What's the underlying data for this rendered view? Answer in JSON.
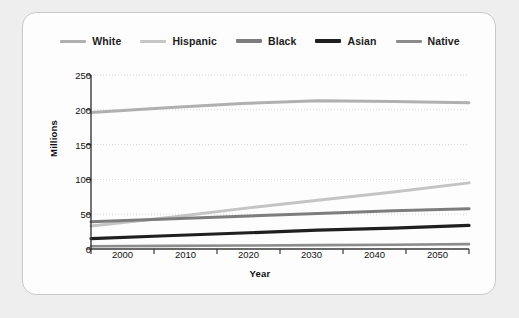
{
  "chart_data": {
    "type": "line",
    "title": "",
    "xlabel": "Year",
    "ylabel": "Millions",
    "x": [
      2000,
      2010,
      2020,
      2030,
      2040,
      2050
    ],
    "xlim": [
      2000,
      2050
    ],
    "ylim": [
      0,
      250
    ],
    "yticks": [
      0,
      50,
      100,
      150,
      200,
      250
    ],
    "xticks": [
      2000,
      2010,
      2020,
      2030,
      2040,
      2050
    ],
    "grid": true,
    "legend_position": "top",
    "series": [
      {
        "name": "White",
        "color": "#b0b0b0",
        "width": 3.0,
        "values": [
          196,
          203,
          209,
          213,
          212,
          210
        ]
      },
      {
        "name": "Hispanic",
        "color": "#c4c4c4",
        "width": 3.0,
        "values": [
          33,
          45,
          58,
          70,
          82,
          95
        ]
      },
      {
        "name": "Black",
        "color": "#7d7d7d",
        "width": 3.0,
        "values": [
          39,
          43,
          47,
          51,
          55,
          58
        ]
      },
      {
        "name": "Asian",
        "color": "#1f1f1f",
        "width": 3.2,
        "values": [
          15,
          19,
          23,
          27,
          30,
          34
        ]
      },
      {
        "name": "Native",
        "color": "#8c8c8c",
        "width": 2.6,
        "values": [
          4,
          4.5,
          5,
          5.5,
          6,
          7
        ]
      }
    ]
  },
  "legend": {
    "items": [
      {
        "label": "White",
        "color": "#b0b0b0",
        "thickness": "3px"
      },
      {
        "label": "Hispanic",
        "color": "#c6c6c6",
        "thickness": "3px"
      },
      {
        "label": "Black",
        "color": "#7d7d7d",
        "thickness": "3.5px"
      },
      {
        "label": "Asian",
        "color": "#1f1f1f",
        "thickness": "4px"
      },
      {
        "label": "Native",
        "color": "#8c8c8c",
        "thickness": "3px"
      }
    ]
  },
  "axes": {
    "ytick_labels": [
      "250",
      "200",
      "150",
      "100",
      "50",
      "0"
    ],
    "xtick_labels": [
      "2000",
      "2010",
      "2020",
      "2030",
      "2040",
      "2050"
    ],
    "ylabel": "Millions",
    "xlabel": "Year"
  },
  "colors": {
    "page_background": "#eeeeee",
    "card_background": "#fdfdfd",
    "card_border": "#c9c9c9",
    "axis": "#3a3a3a",
    "grid": "#d8d8d8",
    "text": "#111111"
  }
}
